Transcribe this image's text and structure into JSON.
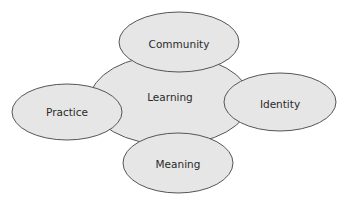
{
  "diagram": {
    "center": {
      "label": "Learning"
    },
    "nodes": [
      {
        "id": "community",
        "label": "Community"
      },
      {
        "id": "practice",
        "label": "Practice"
      },
      {
        "id": "identity",
        "label": "Identity"
      },
      {
        "id": "meaning",
        "label": "Meaning"
      }
    ]
  }
}
